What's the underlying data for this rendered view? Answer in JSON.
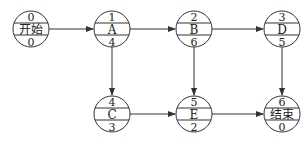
{
  "diagram": {
    "type": "activity-on-node network",
    "nodes": [
      {
        "id": "start",
        "top": "0",
        "label": "开始",
        "bottom": "0",
        "cx": 31,
        "cy": 29
      },
      {
        "id": "A",
        "top": "1",
        "label": "A",
        "bottom": "4",
        "cx": 112,
        "cy": 29
      },
      {
        "id": "B",
        "top": "2",
        "label": "B",
        "bottom": "6",
        "cx": 194,
        "cy": 29
      },
      {
        "id": "D",
        "top": "3",
        "label": "D",
        "bottom": "5",
        "cx": 282,
        "cy": 29
      },
      {
        "id": "C",
        "top": "4",
        "label": "C",
        "bottom": "3",
        "cx": 112,
        "cy": 114
      },
      {
        "id": "E",
        "top": "5",
        "label": "E",
        "bottom": "2",
        "cx": 194,
        "cy": 114
      },
      {
        "id": "end",
        "top": "6",
        "label": "结束",
        "bottom": "0",
        "cx": 282,
        "cy": 114
      }
    ],
    "edges": [
      {
        "from": "start",
        "to": "A"
      },
      {
        "from": "A",
        "to": "B"
      },
      {
        "from": "B",
        "to": "D"
      },
      {
        "from": "A",
        "to": "C"
      },
      {
        "from": "B",
        "to": "E"
      },
      {
        "from": "D",
        "to": "end"
      },
      {
        "from": "C",
        "to": "E"
      },
      {
        "from": "E",
        "to": "end"
      }
    ],
    "colors": {
      "stroke": "#333333",
      "fill": "#ffffff",
      "text": "#222222"
    }
  }
}
